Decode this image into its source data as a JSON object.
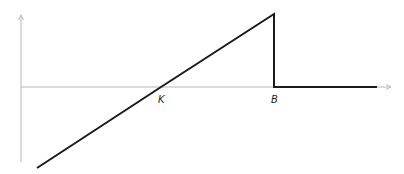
{
  "diagram": {
    "type": "payoff-diagram",
    "axes": {
      "origin": [
        21,
        87
      ],
      "y_axis": {
        "x": 21,
        "top": 14,
        "bottom": 162
      },
      "x_axis": {
        "y": 87,
        "left": 21,
        "right": 392
      },
      "color": "#b8b8b8"
    },
    "curve": {
      "color": "#1a1a1a",
      "points": [
        [
          37,
          168
        ],
        [
          161,
          87
        ],
        [
          274,
          14
        ],
        [
          274,
          87
        ],
        [
          377,
          87
        ]
      ]
    },
    "labels": {
      "k": "K",
      "b": "B"
    }
  }
}
